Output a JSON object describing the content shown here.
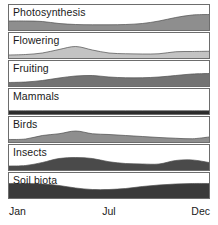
{
  "figure": {
    "panel_border_color": "#6d6d6d",
    "background_color": "#ffffff",
    "text_color": "#1a1a1a"
  },
  "axis": {
    "label": "Month",
    "ticks": [
      {
        "label": "Jan",
        "position": 0
      },
      {
        "label": "Jul",
        "position": 0.5
      },
      {
        "label": "Dec",
        "position": 1
      }
    ]
  },
  "chart_data": {
    "type": "area",
    "xlabel": "",
    "ylabel": "",
    "grid": false,
    "legend": "none",
    "xlim": [
      0,
      12
    ],
    "ylim": [
      0,
      1
    ],
    "x": [
      0,
      1,
      2,
      3,
      4,
      5,
      6,
      7,
      8,
      9,
      10,
      11,
      12
    ],
    "x_tick_labels": [
      "Jan",
      "Jul",
      "Dec"
    ],
    "panels": [
      {
        "name": "Photosynthesis",
        "fill_color": "#8e8e8e",
        "values": [
          0.36,
          0.36,
          0.34,
          0.26,
          0.22,
          0.21,
          0.21,
          0.22,
          0.26,
          0.36,
          0.5,
          0.6,
          0.62
        ]
      },
      {
        "name": "Flowering",
        "fill_color": "#c3c3c3",
        "values": [
          0.12,
          0.14,
          0.2,
          0.34,
          0.46,
          0.32,
          0.2,
          0.17,
          0.16,
          0.17,
          0.25,
          0.26,
          0.27
        ]
      },
      {
        "name": "Fruiting",
        "fill_color": "#737373",
        "values": [
          0.14,
          0.16,
          0.22,
          0.32,
          0.4,
          0.42,
          0.36,
          0.33,
          0.33,
          0.36,
          0.42,
          0.48,
          0.5
        ]
      },
      {
        "name": "Mammals",
        "fill_color": "#2b2b2b",
        "values": [
          0.13,
          0.13,
          0.13,
          0.13,
          0.13,
          0.13,
          0.13,
          0.13,
          0.13,
          0.13,
          0.13,
          0.13,
          0.13
        ]
      },
      {
        "name": "Birds",
        "fill_color": "#8e8e8e",
        "values": [
          0.1,
          0.12,
          0.26,
          0.33,
          0.44,
          0.33,
          0.3,
          0.26,
          0.22,
          0.18,
          0.15,
          0.13,
          0.2
        ]
      },
      {
        "name": "Insects",
        "fill_color": "#4a4a4a",
        "values": [
          0.16,
          0.18,
          0.3,
          0.46,
          0.5,
          0.46,
          0.33,
          0.26,
          0.24,
          0.24,
          0.38,
          0.4,
          0.3
        ]
      },
      {
        "name": "Soil biota",
        "fill_color": "#3a3a3a",
        "values": [
          0.58,
          0.58,
          0.56,
          0.5,
          0.4,
          0.34,
          0.34,
          0.38,
          0.46,
          0.52,
          0.56,
          0.58,
          0.58
        ]
      }
    ]
  }
}
